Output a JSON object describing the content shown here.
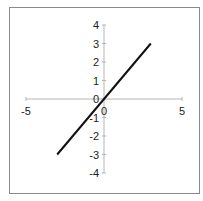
{
  "chart_data": {
    "type": "line",
    "title": "",
    "xlabel": "",
    "ylabel": "",
    "xlim": [
      -5,
      5
    ],
    "ylim": [
      -4,
      4
    ],
    "x_ticks": [
      -5,
      0,
      5
    ],
    "y_ticks": [
      -4,
      -3,
      -2,
      -1,
      0,
      1,
      2,
      3,
      4
    ],
    "x_tick_labels": [
      "-5",
      "0",
      "5"
    ],
    "y_tick_labels": [
      "-4",
      "-3",
      "-2",
      "-1",
      "0",
      "1",
      "2",
      "3",
      "4"
    ],
    "grid": false,
    "legend": null,
    "series": [
      {
        "name": "y = x",
        "x": [
          -3,
          3
        ],
        "y": [
          -3,
          3
        ],
        "color": "#111111"
      }
    ]
  }
}
